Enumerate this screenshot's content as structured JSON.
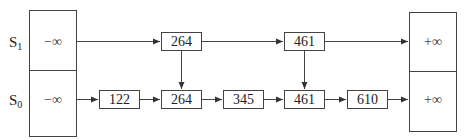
{
  "diagram": {
    "type": "skip-list",
    "levels": [
      {
        "id": "S1",
        "label_main": "S",
        "label_sub": "1",
        "keys": [
          "264",
          "461"
        ]
      },
      {
        "id": "S0",
        "label_main": "S",
        "label_sub": "0",
        "keys": [
          "122",
          "264",
          "345",
          "461",
          "610"
        ]
      }
    ],
    "left_sentinel": "−∞",
    "right_sentinel": "+∞",
    "colors": {
      "stroke": "#444444",
      "text": "#222222",
      "background": "#ffffff"
    }
  }
}
